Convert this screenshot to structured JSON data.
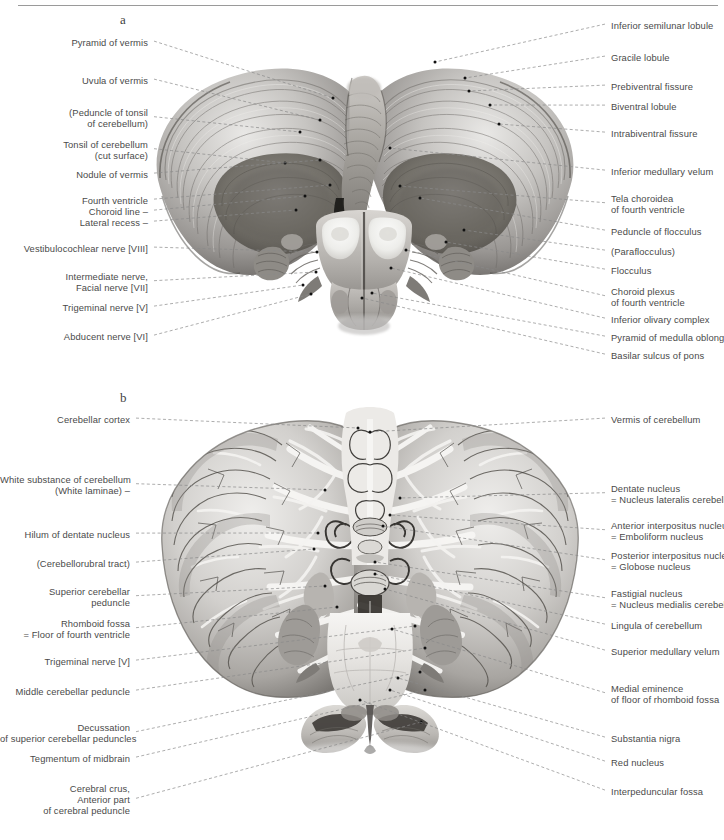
{
  "page": {
    "width": 724,
    "height": 840,
    "background": "#ffffff",
    "rule_color": "#9a9a9a",
    "label_color": "#4a4a4a",
    "leader_color": "#8a8a8a",
    "dot_color": "#111111"
  },
  "panels": [
    {
      "id": "a",
      "letter": "a",
      "letter_x": 120,
      "letter_y": 12,
      "view": "Cerebellum and brainstem, anterior (ventral) view with cut cerebellar peduncles",
      "labels_left": [
        {
          "id": "pyramid-of-vermis",
          "lines": [
            "Pyramid of vermis"
          ],
          "x": 148,
          "y": 37,
          "tx": 333,
          "ty": 98
        },
        {
          "id": "uvula-of-vermis",
          "lines": [
            "Uvula of vermis"
          ],
          "x": 148,
          "y": 75,
          "tx": 320,
          "ty": 120
        },
        {
          "id": "peduncle-of-tonsil",
          "lines": [
            "(Peduncle of tonsil",
            "of cerebellum)"
          ],
          "x": 148,
          "y": 107,
          "tx": 300,
          "ty": 132
        },
        {
          "id": "tonsil-of-cerebellum",
          "lines": [
            "Tonsil of cerebellum",
            "(cut surface)"
          ],
          "x": 148,
          "y": 139,
          "tx": 285,
          "ty": 163
        },
        {
          "id": "nodule-of-vermis",
          "lines": [
            "Nodule of vermis"
          ],
          "x": 148,
          "y": 169,
          "tx": 320,
          "ty": 160
        },
        {
          "id": "fourth-ventricle",
          "lines": [
            "Fourth ventricle"
          ],
          "x": 148,
          "y": 195,
          "tx": 330,
          "ty": 185
        },
        {
          "id": "choroid-line",
          "lines": [
            "Choroid line –"
          ],
          "x": 148,
          "y": 206,
          "tx": 305,
          "ty": 196
        },
        {
          "id": "lateral-recess",
          "lines": [
            "Lateral recess –"
          ],
          "x": 148,
          "y": 217,
          "tx": 296,
          "ty": 210
        },
        {
          "id": "vestibulocochlear-nerve",
          "lines": [
            "Vestibulocochlear nerve [VIII]"
          ],
          "x": 148,
          "y": 243,
          "tx": 317,
          "ty": 252
        },
        {
          "id": "intermediate-facial-nerve",
          "lines": [
            "Intermediate nerve,",
            "Facial nerve [VII]"
          ],
          "x": 148,
          "y": 271,
          "tx": 316,
          "ty": 272
        },
        {
          "id": "trigeminal-nerve-a",
          "lines": [
            "Trigeminal nerve [V]"
          ],
          "x": 148,
          "y": 302,
          "tx": 303,
          "ty": 285
        },
        {
          "id": "abducent-nerve",
          "lines": [
            "Abducent nerve [VI]"
          ],
          "x": 148,
          "y": 331,
          "tx": 311,
          "ty": 294
        }
      ],
      "labels_right": [
        {
          "id": "inferior-semilunar-lobule",
          "lines": [
            "Inferior semilunar lobule"
          ],
          "x": 611,
          "y": 20,
          "tx": 435,
          "ty": 62
        },
        {
          "id": "gracile-lobule",
          "lines": [
            "Gracile lobule"
          ],
          "x": 611,
          "y": 52,
          "tx": 465,
          "ty": 78
        },
        {
          "id": "prebiventral-fissure",
          "lines": [
            "Prebiventral fissure"
          ],
          "x": 611,
          "y": 81,
          "tx": 469,
          "ty": 91
        },
        {
          "id": "biventral-lobule",
          "lines": [
            "Biventral lobule"
          ],
          "x": 611,
          "y": 101,
          "tx": 490,
          "ty": 105
        },
        {
          "id": "intrabiventral-fissure",
          "lines": [
            "Intrabiventral fissure"
          ],
          "x": 611,
          "y": 128,
          "tx": 499,
          "ty": 124
        },
        {
          "id": "inferior-medullary-velum",
          "lines": [
            "Inferior medullary velum"
          ],
          "x": 611,
          "y": 166,
          "tx": 390,
          "ty": 148
        },
        {
          "id": "tela-choroidea",
          "lines": [
            "Tela choroidea",
            "of fourth ventricle"
          ],
          "x": 611,
          "y": 193,
          "tx": 400,
          "ty": 186
        },
        {
          "id": "peduncle-of-flocculus",
          "lines": [
            "Peduncle of flocculus"
          ],
          "x": 611,
          "y": 226,
          "tx": 420,
          "ty": 198
        },
        {
          "id": "paraflocculus",
          "lines": [
            "(Paraflocculus)"
          ],
          "x": 611,
          "y": 246,
          "tx": 464,
          "ty": 230
        },
        {
          "id": "flocculus",
          "lines": [
            "Flocculus"
          ],
          "x": 611,
          "y": 265,
          "tx": 446,
          "ty": 242
        },
        {
          "id": "choroid-plexus",
          "lines": [
            "Choroid plexus",
            "of fourth ventricle"
          ],
          "x": 611,
          "y": 286,
          "tx": 406,
          "ty": 250
        },
        {
          "id": "inferior-olivary-complex",
          "lines": [
            "Inferior olivary complex"
          ],
          "x": 611,
          "y": 314,
          "tx": 391,
          "ty": 268
        },
        {
          "id": "pyramid-of-medulla",
          "lines": [
            "Pyramid of medulla oblongata"
          ],
          "x": 611,
          "y": 332,
          "tx": 372,
          "ty": 293
        },
        {
          "id": "basilar-sulcus-of-pons",
          "lines": [
            "Basilar sulcus of pons"
          ],
          "x": 611,
          "y": 350,
          "tx": 362,
          "ty": 298
        }
      ]
    },
    {
      "id": "b",
      "letter": "b",
      "letter_x": 120,
      "letter_y": 390,
      "view": "Cerebellum and brainstem, horizontal section showing cerebellar nuclei",
      "labels_left": [
        {
          "id": "cerebellar-cortex",
          "lines": [
            "Cerebellar cortex"
          ],
          "x": 130,
          "y": 414,
          "tx": 358,
          "ty": 428
        },
        {
          "id": "white-substance",
          "lines": [
            "White substance of cerebellum",
            "(White laminae) –"
          ],
          "x": 130,
          "y": 474,
          "tx": 325,
          "ty": 490
        },
        {
          "id": "white-substance-2",
          "lines": [
            ""
          ],
          "x": 130,
          "y": 496,
          "tx": 318,
          "ty": 503
        },
        {
          "id": "hilum-of-dentate-nucleus",
          "lines": [
            "Hilum of dentate nucleus"
          ],
          "x": 130,
          "y": 529,
          "tx": 318,
          "ty": 533
        },
        {
          "id": "cerebellorubral-tract",
          "lines": [
            "(Cerebellorubral tract)"
          ],
          "x": 130,
          "y": 558,
          "tx": 314,
          "ty": 549
        },
        {
          "id": "superior-cerebellar-peduncle",
          "lines": [
            "Superior cerebellar",
            "peduncle"
          ],
          "x": 130,
          "y": 586,
          "tx": 325,
          "ty": 586
        },
        {
          "id": "rhomboid-fossa",
          "lines": [
            "Rhomboid fossa",
            "= Floor of fourth ventricle"
          ],
          "x": 130,
          "y": 618,
          "tx": 337,
          "ty": 607
        },
        {
          "id": "trigeminal-nerve-b",
          "lines": [
            "Trigeminal nerve [V]"
          ],
          "x": 130,
          "y": 656,
          "tx": 415,
          "ty": 626
        },
        {
          "id": "middle-cerebellar-peduncle",
          "lines": [
            "Middle cerebellar peduncle"
          ],
          "x": 130,
          "y": 686,
          "tx": 425,
          "ty": 648
        },
        {
          "id": "decussation-scp",
          "lines": [
            "Decussation",
            "of superior cerebellar peduncles"
          ],
          "x": 130,
          "y": 722,
          "tx": 420,
          "ty": 672
        },
        {
          "id": "tegmentum-of-midbrain",
          "lines": [
            "Tegmentum of midbrain"
          ],
          "x": 130,
          "y": 753,
          "tx": 425,
          "ty": 690
        },
        {
          "id": "cerebral-crus",
          "lines": [
            "Cerebral crus,",
            "Anterior part",
            "of cerebral peduncle"
          ],
          "x": 130,
          "y": 783,
          "tx": 421,
          "ty": 722
        }
      ],
      "labels_right": [
        {
          "id": "vermis-of-cerebellum",
          "lines": [
            "Vermis of cerebellum"
          ],
          "x": 611,
          "y": 414,
          "tx": 370,
          "ty": 432
        },
        {
          "id": "dentate-nucleus",
          "lines": [
            "Dentate nucleus",
            "= Nucleus lateralis cerebelli"
          ],
          "x": 611,
          "y": 483,
          "tx": 400,
          "ty": 498
        },
        {
          "id": "anterior-interpositus-nucleus",
          "lines": [
            "Anterior interpositus nucleus",
            "= Emboliform nucleus"
          ],
          "x": 611,
          "y": 520,
          "tx": 390,
          "ty": 515
        },
        {
          "id": "posterior-interpositus-nucleus",
          "lines": [
            "Posterior interpositus nucleus",
            "= Globose nucleus"
          ],
          "x": 611,
          "y": 550,
          "tx": 383,
          "ty": 526
        },
        {
          "id": "fastigial-nucleus",
          "lines": [
            "Fastigial nucleus",
            "= Nucleus medialis cerebelli"
          ],
          "x": 611,
          "y": 588,
          "tx": 375,
          "ty": 562
        },
        {
          "id": "lingula-of-cerebellum",
          "lines": [
            "Lingula of cerebellum"
          ],
          "x": 611,
          "y": 620,
          "tx": 375,
          "ty": 574
        },
        {
          "id": "superior-medullary-velum",
          "lines": [
            "Superior medullary velum"
          ],
          "x": 611,
          "y": 646,
          "tx": 385,
          "ty": 589
        },
        {
          "id": "medial-eminence",
          "lines": [
            "Medial eminence",
            "of floor of rhomboid fossa"
          ],
          "x": 611,
          "y": 683,
          "tx": 392,
          "ty": 629
        },
        {
          "id": "substantia-nigra",
          "lines": [
            "Substantia nigra"
          ],
          "x": 611,
          "y": 733,
          "tx": 398,
          "ty": 678
        },
        {
          "id": "red-nucleus",
          "lines": [
            "Red nucleus"
          ],
          "x": 611,
          "y": 757,
          "tx": 390,
          "ty": 690
        },
        {
          "id": "interpeduncular-fossa",
          "lines": [
            "Interpeduncular fossa"
          ],
          "x": 611,
          "y": 786,
          "tx": 360,
          "ty": 700
        }
      ]
    }
  ]
}
